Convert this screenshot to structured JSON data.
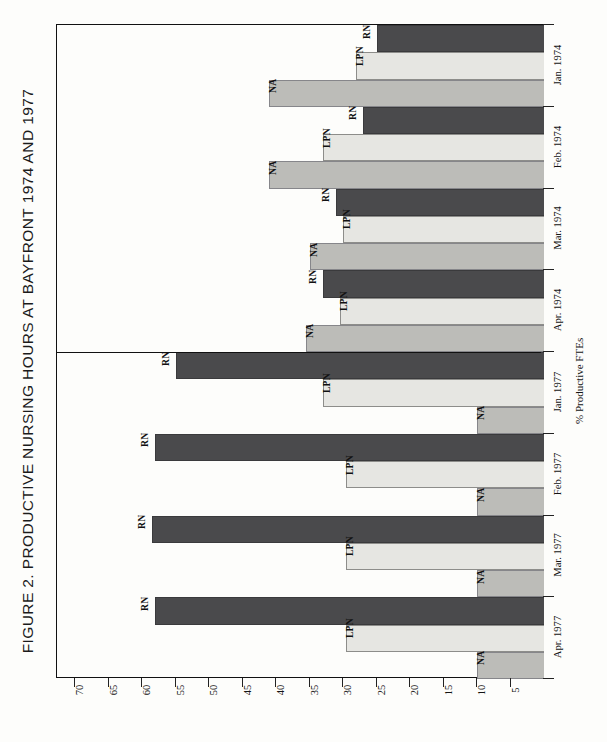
{
  "figure": {
    "title": "FIGURE 2.  PRODUCTIVE NURSING HOURS AT BAYFRONT 1974 AND 1977",
    "axis_title": "% Productive FTEs"
  },
  "chart_data": {
    "type": "bar",
    "orientation": "horizontal-rotated",
    "title": "FIGURE 2.  PRODUCTIVE NURSING HOURS AT BAYFRONT 1974 AND 1977",
    "xlabel": "",
    "ylabel": "% Productive FTEs",
    "categories": [
      "Jan. 1974",
      "Feb. 1974",
      "Mar. 1974",
      "Apr. 1974",
      "Jan. 1977",
      "Feb. 1977",
      "Mar. 1977",
      "Apr. 1977"
    ],
    "series": [
      {
        "name": "RN",
        "color": "#4a4a4c",
        "values": [
          25,
          27,
          31,
          33,
          55,
          58,
          58.5,
          58
        ]
      },
      {
        "name": "LPN",
        "color": "#e6e6e2",
        "values": [
          28,
          33,
          30,
          30.5,
          33,
          29.5,
          29.5,
          29.5
        ]
      },
      {
        "name": "NA",
        "color": "#bcbcb8",
        "values": [
          41,
          41,
          35,
          35.5,
          10,
          10,
          10,
          10
        ]
      }
    ],
    "ticks": [
      70,
      65,
      60,
      55,
      50,
      45,
      40,
      35,
      30,
      25,
      20,
      15,
      10,
      5
    ],
    "xlim": [
      0,
      73
    ],
    "grid": false,
    "legend": "inline-bar-labels",
    "annotations": [
      "Bars are labelled in place with RN, LPN and NA.",
      "A horizontal rule separates the 1974 block from the 1977 block."
    ]
  },
  "bar_labels": {
    "RN": "RN",
    "LPN": "LPN",
    "NA": "NA"
  }
}
